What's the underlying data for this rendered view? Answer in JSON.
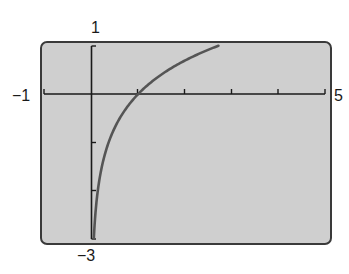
{
  "chart_data": {
    "type": "line",
    "title": "",
    "xlabel": "",
    "ylabel": "",
    "function": "y = ln x",
    "xlim": [
      -1,
      5
    ],
    "ylim": [
      -3,
      1
    ],
    "xscale": 1,
    "yscale": 1,
    "grid": false,
    "window_labels": {
      "xmin": "−1",
      "xmax": "5",
      "ymin": "−3",
      "ymax": "1"
    },
    "series": [
      {
        "name": "ln x",
        "x": [
          0.05,
          0.1,
          0.2,
          0.3,
          0.5,
          0.75,
          1,
          1.5,
          2,
          2.5,
          2.718
        ],
        "y": [
          -3.0,
          -2.3,
          -1.61,
          -1.2,
          -0.69,
          -0.29,
          0,
          0.41,
          0.69,
          0.92,
          1.0
        ]
      }
    ],
    "colors": {
      "screen": "#cfcfcf",
      "curve": "#555555",
      "axes": "#1a1a1a"
    }
  }
}
